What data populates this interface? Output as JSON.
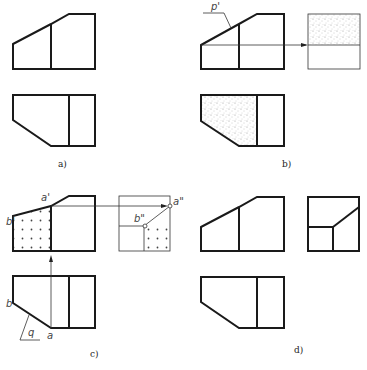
{
  "figure": {
    "panels": [
      {
        "id": "a",
        "caption": "a)"
      },
      {
        "id": "b",
        "caption": "b)",
        "labels": {
          "plane": "p'"
        }
      },
      {
        "id": "c",
        "caption": "c)",
        "labels": {
          "a_front": "a'",
          "b_front": "b'",
          "a_side": "a\"",
          "b_side": "b\"",
          "a_top": "a",
          "b_top": "b",
          "plane": "q"
        }
      },
      {
        "id": "d",
        "caption": "d)"
      }
    ],
    "colors": {
      "line": "#1a1a1a",
      "thin": "#333333",
      "fill_stipple": "#888888",
      "background": "#ffffff"
    }
  }
}
